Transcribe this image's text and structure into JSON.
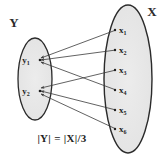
{
  "figure": {
    "type": "set-mapping-diagram",
    "caption": "|Y| = |X|/3",
    "formula": {
      "left": "|Y|",
      "equals": "=",
      "right": "|X|/3",
      "full": "|Y| = |X|/3"
    },
    "colors": {
      "stroke": "#2b2b2b",
      "ellipse_fill": "#e8e8e8",
      "arrow": "#3a3a3a",
      "text": "#1f1f1f",
      "background": "#ffffff"
    }
  },
  "sets": {
    "domain": {
      "label": "Y",
      "label_position": "top-left",
      "nodes": [
        {
          "id": "y1",
          "base": "y",
          "sub": "1",
          "text": "y₁",
          "cx": 33,
          "cy": 60
        },
        {
          "id": "y2",
          "base": "y",
          "sub": "2",
          "text": "y₂",
          "cx": 33,
          "cy": 91
        }
      ],
      "ellipse": {
        "cx": 35,
        "cy": 79,
        "rx": 17,
        "ry": 41
      }
    },
    "codomain": {
      "label": "X",
      "label_position": "top-right",
      "nodes": [
        {
          "id": "x1",
          "base": "x",
          "sub": "1",
          "text": "x₁",
          "cx": 119,
          "cy": 30
        },
        {
          "id": "x2",
          "base": "x",
          "sub": "2",
          "text": "x₂",
          "cx": 119,
          "cy": 50
        },
        {
          "id": "x3",
          "base": "x",
          "sub": "3",
          "text": "x₃",
          "cx": 119,
          "cy": 70
        },
        {
          "id": "x4",
          "base": "x",
          "sub": "4",
          "text": "x₄",
          "cx": 119,
          "cy": 90
        },
        {
          "id": "x5",
          "base": "x",
          "sub": "5",
          "text": "x₅",
          "cx": 119,
          "cy": 110
        },
        {
          "id": "x6",
          "base": "x",
          "sub": "6",
          "text": "x₆",
          "cx": 119,
          "cy": 129
        }
      ],
      "ellipse": {
        "cx": 128,
        "cy": 79,
        "rx": 24,
        "ry": 74
      }
    }
  },
  "edges": [
    {
      "from": "x1",
      "to": "y1"
    },
    {
      "from": "x2",
      "to": "y1"
    },
    {
      "from": "x3",
      "to": "y2"
    },
    {
      "from": "x4",
      "to": "y1"
    },
    {
      "from": "x5",
      "to": "y2"
    },
    {
      "from": "x6",
      "to": "y2"
    }
  ],
  "counts": {
    "domain_size": 2,
    "codomain_size": 6,
    "ratio": 3
  }
}
